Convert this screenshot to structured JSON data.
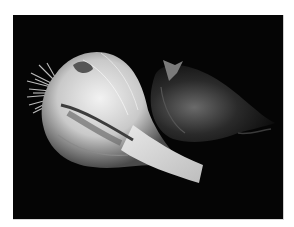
{
  "image": {
    "subject": "garlic bulbs on black background",
    "style": "black and white photograph",
    "background_color": "#050505",
    "frame_color": "#ffffff",
    "objects": [
      {
        "name": "garlic-bulb-large",
        "description": "large whole garlic bulb with roots, lying on its side, bright white"
      },
      {
        "name": "garlic-clove-dark",
        "description": "darker garlic bulb/clove in shadow on the right"
      }
    ]
  }
}
